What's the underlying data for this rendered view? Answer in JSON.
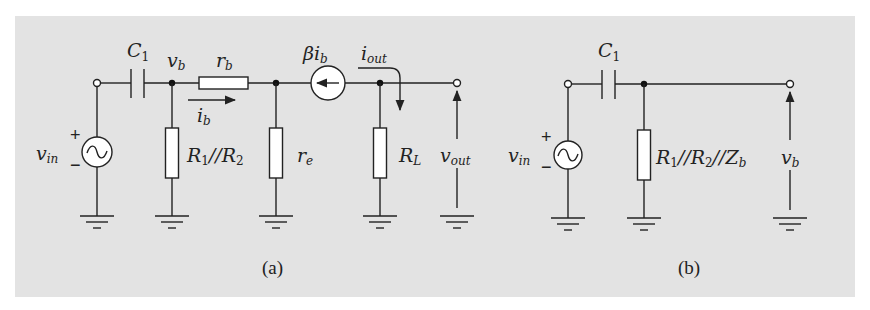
{
  "colors": {
    "panel_background": "#e3e3e3",
    "page_background": "#ffffff",
    "line": "#222222"
  },
  "diagram_a": {
    "caption": "(a)",
    "source": {
      "name": "v",
      "sub": "in",
      "plus": "+",
      "minus": "−"
    },
    "capacitor": {
      "name": "C",
      "sub": "1"
    },
    "node_voltage": {
      "name": "v",
      "sub": "b"
    },
    "base_resistor": {
      "name": "r",
      "sub": "b"
    },
    "base_current": {
      "name": "i",
      "sub": "b"
    },
    "bias_resistor": {
      "name": "R",
      "sub1": "1",
      "sep": "//",
      "name2": "R",
      "sub2": "2"
    },
    "emitter_resistor": {
      "name": "r",
      "sub": "e"
    },
    "dependent_source": {
      "prefix": "β",
      "name": "i",
      "sub": "b"
    },
    "output_current": {
      "name": "i",
      "sub": "out"
    },
    "load_resistor": {
      "name": "R",
      "sub": "L"
    },
    "output_voltage": {
      "name": "v",
      "sub": "out"
    }
  },
  "diagram_b": {
    "caption": "(b)",
    "source": {
      "name": "v",
      "sub": "in",
      "plus": "+",
      "minus": "−"
    },
    "capacitor": {
      "name": "C",
      "sub": "1"
    },
    "equivalent_resistor": {
      "name": "R",
      "sub1": "1",
      "sep1": "//",
      "name2": "R",
      "sub2": "2",
      "sep2": "//",
      "name3": "Z",
      "sub3": "b"
    },
    "output_voltage": {
      "name": "v",
      "sub": "b"
    }
  }
}
